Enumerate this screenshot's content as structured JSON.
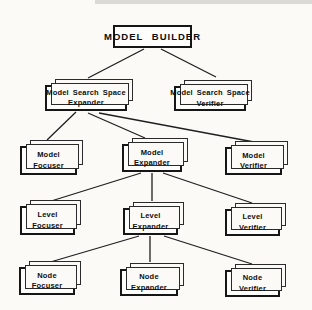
{
  "diagram": {
    "root": {
      "id": "model-builder",
      "label": "MODEL BUILDER"
    },
    "nodes": [
      {
        "id": "model-search-space-expander",
        "line1": "Model Search Space",
        "line2": "Expander"
      },
      {
        "id": "model-search-space-verifier",
        "line1": "Model Search Space",
        "line2": "Verifier"
      },
      {
        "id": "model-focuser",
        "line1": "Model",
        "line2": "Focuser"
      },
      {
        "id": "model-expander",
        "line1": "Model",
        "line2": "Expander"
      },
      {
        "id": "model-verifier",
        "line1": "Model",
        "line2": "Verifier"
      },
      {
        "id": "level-focuser",
        "line1": "Level",
        "line2": "Focuser"
      },
      {
        "id": "level-expander",
        "line1": "Level",
        "line2": "Expander"
      },
      {
        "id": "level-verifier",
        "line1": "Level",
        "line2": "Verifier"
      },
      {
        "id": "node-focuser",
        "line1": "Node",
        "line2": "Focuser"
      },
      {
        "id": "node-expander",
        "line1": "Node",
        "line2": "Expander"
      },
      {
        "id": "node-verifier",
        "line1": "Node",
        "line2": "Verifier"
      }
    ],
    "edges": [
      {
        "from": "model-builder",
        "to": "model-search-space-expander"
      },
      {
        "from": "model-builder",
        "to": "model-search-space-verifier"
      },
      {
        "from": "model-search-space-expander",
        "to": "model-focuser"
      },
      {
        "from": "model-search-space-expander",
        "to": "model-expander"
      },
      {
        "from": "model-search-space-expander",
        "to": "model-verifier"
      },
      {
        "from": "model-expander",
        "to": "level-focuser"
      },
      {
        "from": "model-expander",
        "to": "level-expander"
      },
      {
        "from": "model-expander",
        "to": "level-verifier"
      },
      {
        "from": "level-expander",
        "to": "node-focuser"
      },
      {
        "from": "level-expander",
        "to": "node-expander"
      },
      {
        "from": "level-expander",
        "to": "node-verifier"
      }
    ],
    "colors": {
      "line": "#1f1f1f",
      "box_border": "#161616",
      "box_fill": "#fdfdfb",
      "background": "#fbfaf7"
    }
  }
}
